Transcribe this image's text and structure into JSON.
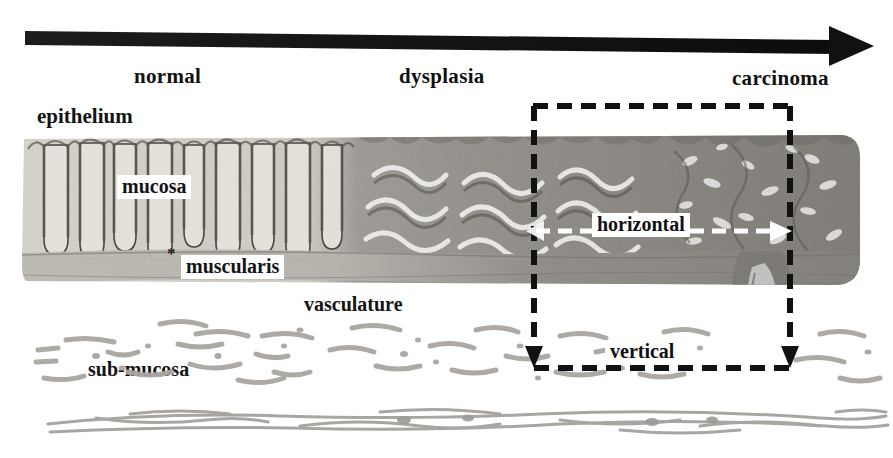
{
  "figure": {
    "type": "histology-micrograph-annotated"
  },
  "progression_arrow": {
    "name": "progression-arrow",
    "direction": "left-to-right",
    "color": "#1a1a1a",
    "start_stage": "normal",
    "end_stage": "carcinoma"
  },
  "stages": [
    {
      "id": "normal",
      "label": "normal",
      "x": 134
    },
    {
      "id": "dysplasia",
      "label": "dysplasia",
      "x": 399
    },
    {
      "id": "carcinoma",
      "label": "carcinoma",
      "x": 732
    }
  ],
  "annotations": {
    "epithelium": "epithelium",
    "mucosa": "mucosa",
    "muscularis": "muscularis",
    "vasculature": "vasculature",
    "submucosa": "sub-mucosa",
    "star_marker": "*"
  },
  "roi": {
    "name": "region-of-interest",
    "style": "dashed",
    "color": "#111111",
    "horizontal_label": "horizontal",
    "vertical_label": "vertical",
    "horizontal_arrow_color": "#ffffff",
    "vertical_arrow_color": "#111111"
  },
  "colors": {
    "background": "#ffffff",
    "ink": "#111111",
    "normal_tissue": "#cfcbc4",
    "dysplasia_tissue": "#8e8a85",
    "carcinoma_tissue": "#7d7a76",
    "muscularis_band": "#b6b2ac",
    "vessel": "#a9a5a0"
  }
}
